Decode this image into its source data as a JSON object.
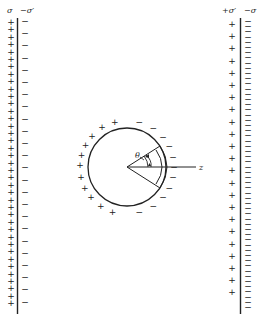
{
  "figure": {
    "left_plate": {
      "label_outer": "σ",
      "label_inner": "−σ′",
      "outer_charge_symbol": "+",
      "inner_charge_symbol": "−"
    },
    "right_plate": {
      "label_inner": "+σ′",
      "label_outer": "−σ",
      "inner_charge_symbol": "+",
      "outer_charge_symbol": "−"
    },
    "sphere": {
      "left_surface_charge": "+",
      "right_surface_charge": "−",
      "angle_label": "θ",
      "axis_label": "z"
    }
  },
  "colors": {
    "ink": "#222222",
    "background": "#ffffff"
  }
}
